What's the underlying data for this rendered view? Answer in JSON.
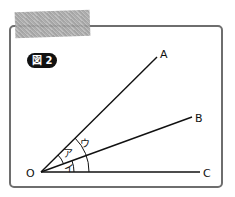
{
  "figure": {
    "badge_label": "図 2",
    "points": {
      "origin": "O",
      "a": "A",
      "b": "B",
      "c": "C"
    },
    "angles": {
      "a_b": "ア",
      "b_c": "イ",
      "a_c": "ウ"
    },
    "colors": {
      "line": "#111111",
      "frame": "#6e6e6e",
      "tape": "#a8a8a8",
      "badge_bg": "#111111"
    }
  }
}
